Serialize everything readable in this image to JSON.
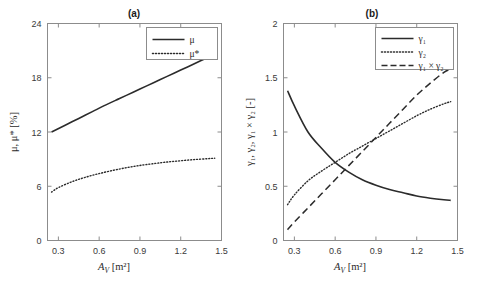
{
  "figure": {
    "background": "#ffffff",
    "line_color": "#2b2b2b",
    "axis_color": "#8c8c8c"
  },
  "chart_data": [
    {
      "type": "line",
      "panel": "a",
      "title": "(a)",
      "xlabel": "A_V  [m²]",
      "xlabel_main": "A",
      "xlabel_sub": "V",
      "xlabel_unit": "[m²]",
      "ylabel": "μ, μ*  [%]",
      "xlim": [
        0.22,
        1.5
      ],
      "ylim": [
        0,
        24
      ],
      "xticks": [
        0.3,
        0.6,
        0.9,
        1.2,
        1.5
      ],
      "xticklabels": [
        "0.3",
        "0.6",
        "0.9",
        "1.2",
        "1.5"
      ],
      "yticks": [
        0,
        6,
        12,
        18,
        24
      ],
      "yticklabels": [
        "0",
        "6",
        "12",
        "18",
        "24"
      ],
      "grid": false,
      "legend_position": "upper right",
      "series": [
        {
          "name": "μ",
          "style": "solid",
          "x": [
            0.25,
            0.35,
            0.45,
            0.55,
            0.65,
            0.75,
            0.85,
            0.95,
            1.05,
            1.15,
            1.25,
            1.35,
            1.45
          ],
          "values": [
            12.0,
            12.75,
            13.5,
            14.25,
            15.0,
            15.7,
            16.4,
            17.1,
            17.8,
            18.5,
            19.2,
            19.9,
            20.6
          ]
        },
        {
          "name": "μ*",
          "style": "dotted",
          "x": [
            0.25,
            0.3,
            0.4,
            0.5,
            0.6,
            0.7,
            0.8,
            0.9,
            1.0,
            1.1,
            1.2,
            1.3,
            1.4,
            1.45
          ],
          "values": [
            5.35,
            5.85,
            6.5,
            7.0,
            7.4,
            7.75,
            8.05,
            8.3,
            8.5,
            8.68,
            8.82,
            8.95,
            9.05,
            9.1
          ]
        }
      ]
    },
    {
      "type": "line",
      "panel": "b",
      "title": "(b)",
      "xlabel": "A_V  [m²]",
      "xlabel_main": "A",
      "xlabel_sub": "V",
      "xlabel_unit": "[m²]",
      "ylabel": "γ₁, γ₂, γ₁ × γ₂  [-]",
      "xlim": [
        0.22,
        1.5
      ],
      "ylim": [
        0,
        2
      ],
      "xticks": [
        0.3,
        0.6,
        0.9,
        1.2,
        1.5
      ],
      "xticklabels": [
        "0.3",
        "0.6",
        "0.9",
        "1.2",
        "1.5"
      ],
      "yticks": [
        0,
        0.5,
        1,
        1.5,
        2
      ],
      "yticklabels": [
        "0",
        "0.5",
        "1",
        "1.5",
        "2"
      ],
      "grid": false,
      "legend_position": "upper right",
      "series": [
        {
          "name": "γ₁",
          "style": "solid",
          "x": [
            0.25,
            0.3,
            0.4,
            0.5,
            0.6,
            0.7,
            0.8,
            0.9,
            1.0,
            1.1,
            1.2,
            1.3,
            1.4,
            1.45
          ],
          "values": [
            1.38,
            1.24,
            1.0,
            0.85,
            0.72,
            0.63,
            0.56,
            0.51,
            0.47,
            0.44,
            0.41,
            0.39,
            0.375,
            0.37
          ]
        },
        {
          "name": "γ₂",
          "style": "dotted",
          "x": [
            0.25,
            0.3,
            0.4,
            0.5,
            0.6,
            0.7,
            0.8,
            0.9,
            1.0,
            1.1,
            1.2,
            1.3,
            1.4,
            1.45
          ],
          "values": [
            0.33,
            0.42,
            0.55,
            0.64,
            0.72,
            0.8,
            0.87,
            0.94,
            1.01,
            1.08,
            1.15,
            1.21,
            1.26,
            1.28
          ]
        },
        {
          "name": "γ₁ × γ₂",
          "style": "dashed",
          "x": [
            0.25,
            0.3,
            0.4,
            0.5,
            0.6,
            0.7,
            0.8,
            0.9,
            1.0,
            1.1,
            1.2,
            1.3,
            1.4,
            1.45
          ],
          "values": [
            0.1,
            0.17,
            0.3,
            0.43,
            0.56,
            0.69,
            0.82,
            0.95,
            1.08,
            1.21,
            1.34,
            1.45,
            1.55,
            1.58
          ]
        }
      ]
    }
  ],
  "legends": {
    "a": [
      {
        "label": "μ",
        "style": "solid"
      },
      {
        "label": "μ*",
        "style": "dotted"
      }
    ],
    "b": [
      {
        "label": "γ₁",
        "style": "solid"
      },
      {
        "label": "γ₂",
        "style": "dotted"
      },
      {
        "label": "γ₁ × γ₂",
        "style": "dashed"
      }
    ]
  }
}
